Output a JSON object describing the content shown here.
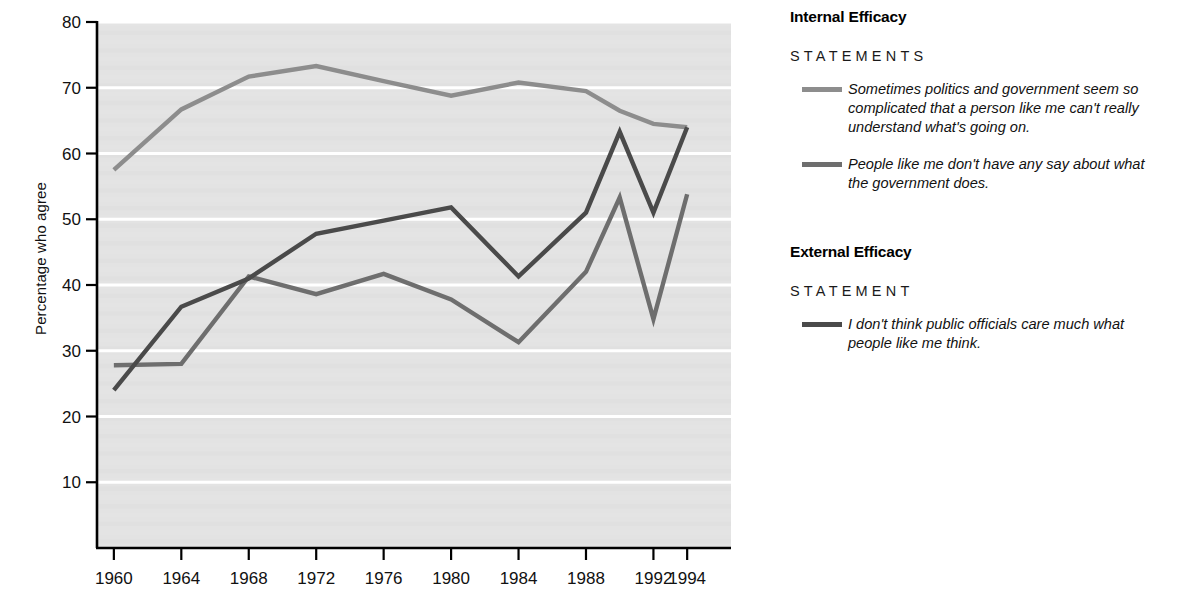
{
  "chart_data": {
    "type": "line",
    "title": "",
    "xlabel": "",
    "ylabel": "Percentage who agree",
    "xlim": [
      1959,
      1995
    ],
    "ylim": [
      0,
      80
    ],
    "grid": "horizontal",
    "legend_position": "right",
    "x": [
      1960,
      1964,
      1968,
      1972,
      1976,
      1980,
      1984,
      1988,
      1990,
      1992,
      1994
    ],
    "xtick_labels": [
      "1960",
      "1964",
      "1968",
      "1972",
      "1976",
      "1980",
      "1984",
      "1988",
      "1992",
      "1994"
    ],
    "xtick_values": [
      1960,
      1964,
      1968,
      1972,
      1976,
      1980,
      1984,
      1988,
      1992,
      1994
    ],
    "ytick_labels": [
      "10",
      "20",
      "30",
      "40",
      "50",
      "60",
      "70",
      "80"
    ],
    "ytick_values": [
      10,
      20,
      30,
      40,
      50,
      60,
      70,
      80
    ],
    "series": [
      {
        "name": "Sometimes politics and government seem so complicated that a person like me can't really understand what's going on.",
        "short_name": "politics-too-complicated",
        "color": "#8d8d8d",
        "values": [
          57.5,
          66.7,
          71.7,
          73.3,
          71.0,
          68.8,
          70.8,
          69.5,
          66.5,
          64.5,
          64.0
        ]
      },
      {
        "name": "People like me don't have any say about what the government does.",
        "short_name": "no-say-in-government",
        "color": "#6e6e6e",
        "values": [
          27.8,
          28.0,
          41.3,
          38.6,
          41.7,
          37.8,
          31.3,
          42.0,
          53.3,
          34.8,
          53.8
        ]
      },
      {
        "name": "I don't think public officials care much what people like me think.",
        "short_name": "officials-dont-care",
        "color": "#4a4a4a",
        "values": [
          24.0,
          36.7,
          41.0,
          47.8,
          49.8,
          51.8,
          41.3,
          51.0,
          63.3,
          51.0,
          64.0
        ]
      }
    ]
  },
  "axis": {
    "ylabel": "Percentage who agree"
  },
  "legend": {
    "groups": [
      {
        "title": "Internal Efficacy",
        "subtitle": "STATEMENTS",
        "entries": [
          {
            "color": "#8d8d8d",
            "text": "Sometimes politics and government seem so complicated that a person like me can't really understand what's going on."
          },
          {
            "color": "#6e6e6e",
            "text": "People like me don't have any say about what the government does."
          }
        ]
      },
      {
        "title": "External Efficacy",
        "subtitle": "STATEMENT",
        "entries": [
          {
            "color": "#4a4a4a",
            "text": "I don't think public officials care much what people like me think."
          }
        ]
      }
    ]
  },
  "colors": {
    "plot_background": "#e3e3e3",
    "gridline": "#ffffff",
    "axis": "#000000",
    "series_light": "#8d8d8d",
    "series_medium": "#6e6e6e",
    "series_dark": "#4a4a4a"
  }
}
